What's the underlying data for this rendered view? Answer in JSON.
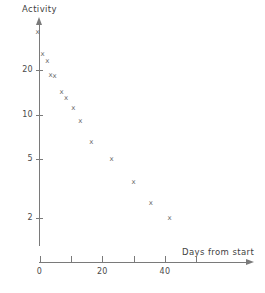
{
  "chart_data": {
    "type": "scatter",
    "title": "",
    "xlabel": "Days from start",
    "ylabel": "Activity",
    "yscale": "log",
    "xscale": "linear",
    "xlim": [
      0,
      66
    ],
    "ylim": [
      1.55,
      40
    ],
    "grid": false,
    "legend": null,
    "marker": "x",
    "x_ticks": [
      {
        "value": 0,
        "label": "0"
      },
      {
        "value": 10,
        "label": ""
      },
      {
        "value": 20,
        "label": "20"
      },
      {
        "value": 30,
        "label": ""
      },
      {
        "value": 40,
        "label": "40"
      },
      {
        "value": 50,
        "label": ""
      }
    ],
    "y_ticks": [
      {
        "value": 20,
        "label": "20"
      },
      {
        "value": 10,
        "label": "10"
      },
      {
        "value": 5,
        "label": "5"
      },
      {
        "value": 2,
        "label": "2"
      }
    ],
    "x": [
      -0.6,
      1.0,
      2.5,
      3.5,
      4.8,
      7.0,
      8.5,
      10.8,
      13.0,
      16.5,
      23.0,
      30.0,
      35.5,
      41.5
    ],
    "y": [
      36.0,
      25.5,
      23.0,
      18.5,
      18.0,
      14.0,
      12.8,
      11.0,
      9.0,
      6.5,
      5.0,
      3.5,
      2.5,
      2.0
    ],
    "points": [
      {
        "x": -0.6,
        "y": 36.0
      },
      {
        "x": 1.0,
        "y": 25.5
      },
      {
        "x": 2.5,
        "y": 23.0
      },
      {
        "x": 3.5,
        "y": 18.5
      },
      {
        "x": 4.8,
        "y": 18.0
      },
      {
        "x": 7.0,
        "y": 14.0
      },
      {
        "x": 8.5,
        "y": 12.8
      },
      {
        "x": 10.8,
        "y": 11.0
      },
      {
        "x": 13.0,
        "y": 9.0
      },
      {
        "x": 16.5,
        "y": 6.5
      },
      {
        "x": 23.0,
        "y": 5.0
      },
      {
        "x": 30.0,
        "y": 3.5
      },
      {
        "x": 35.5,
        "y": 2.5
      },
      {
        "x": 41.5,
        "y": 2.0
      }
    ],
    "marker_glyph": "x",
    "colors": {
      "axis": "#7a7a7a",
      "text": "#4a4a4a",
      "marker": "#6b6b6b",
      "background": "#ffffff"
    }
  },
  "axes": {
    "y_title": "Activity",
    "x_title": "Days from start"
  }
}
